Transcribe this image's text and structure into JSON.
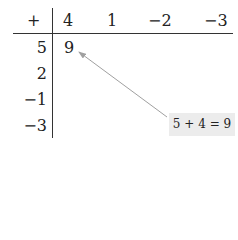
{
  "table": {
    "operator": "+",
    "column_headers": [
      "4",
      "1",
      "−2",
      "−3"
    ],
    "row_headers": [
      "5",
      "2",
      "−1",
      "−3"
    ],
    "filled_cell": {
      "row": 0,
      "col": 0,
      "value": "9"
    }
  },
  "callout": {
    "text": "5 + 4 = 9",
    "background": "#ececec"
  },
  "arrow_color": "#a0a0a0"
}
